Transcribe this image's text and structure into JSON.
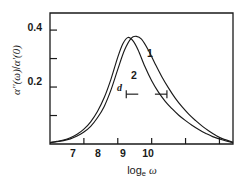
{
  "figure": {
    "background_color": "#ffffff",
    "line_color": "#1a1a1a",
    "axis_color": "#1a1a1a"
  },
  "axes": {
    "ylabel_parts": {
      "alpha_dd": "α′′(ω)",
      "slash": "/",
      "alpha_d": "α′(0)"
    },
    "xlabel_parts": {
      "log": "log",
      "base": "e",
      "omega": "ω"
    },
    "ytick_labels": [
      "0.2",
      "0.4"
    ],
    "xtick_labels": [
      "7",
      "8",
      "9",
      "10"
    ]
  },
  "annotations": {
    "curve1_label": "1",
    "curve2_label": "2",
    "distance_label": "d"
  },
  "chart_data": {
    "type": "line",
    "title": "",
    "xlabel": "log_e ω",
    "ylabel": "α′′(ω)/α′(0)",
    "xlim": [
      6.0,
      11.4
    ],
    "ylim": [
      0.0,
      0.46
    ],
    "xticks": [
      7,
      8,
      9,
      10
    ],
    "xticks_minor": [
      11
    ],
    "yticks": [
      0.2,
      0.4
    ],
    "yticks_minor": [
      0.1,
      0.3
    ],
    "grid": false,
    "legend": "inline-curve-labels",
    "annotations": [
      {
        "text": "d",
        "type": "double-arrow",
        "x_start": 8.25,
        "x_end": 9.45,
        "y": 0.175,
        "meaning": "peak separation width marker"
      },
      {
        "text": "1",
        "x": 9.35,
        "y": 0.315
      },
      {
        "text": "2",
        "x": 8.85,
        "y": 0.235
      }
    ],
    "series": [
      {
        "name": "1",
        "comment": "broader relaxation peak, shifted to higher frequency",
        "x": [
          6.0,
          6.2,
          6.4,
          6.6,
          6.8,
          7.0,
          7.2,
          7.4,
          7.6,
          7.8,
          8.0,
          8.2,
          8.4,
          8.55,
          8.7,
          8.9,
          9.1,
          9.3,
          9.5,
          9.7,
          9.9,
          10.1,
          10.3,
          10.5,
          10.7,
          10.9,
          11.1,
          11.4
        ],
        "y": [
          0.005,
          0.008,
          0.012,
          0.018,
          0.028,
          0.042,
          0.062,
          0.092,
          0.132,
          0.19,
          0.262,
          0.33,
          0.372,
          0.378,
          0.368,
          0.33,
          0.282,
          0.236,
          0.196,
          0.16,
          0.13,
          0.104,
          0.082,
          0.062,
          0.045,
          0.03,
          0.018,
          0.006
        ]
      },
      {
        "name": "2",
        "comment": "narrower relaxation peak, lower frequency maximum",
        "x": [
          6.0,
          6.2,
          6.4,
          6.6,
          6.8,
          7.0,
          7.2,
          7.4,
          7.6,
          7.8,
          8.0,
          8.15,
          8.3,
          8.45,
          8.6,
          8.8,
          9.0,
          9.2,
          9.4,
          9.6,
          9.8,
          10.0,
          10.2,
          10.4,
          10.6,
          10.8,
          11.1,
          11.4
        ],
        "y": [
          0.005,
          0.009,
          0.014,
          0.022,
          0.034,
          0.052,
          0.078,
          0.114,
          0.163,
          0.228,
          0.305,
          0.352,
          0.374,
          0.362,
          0.33,
          0.272,
          0.222,
          0.182,
          0.15,
          0.124,
          0.101,
          0.082,
          0.065,
          0.05,
          0.037,
          0.026,
          0.014,
          0.005
        ]
      }
    ]
  }
}
